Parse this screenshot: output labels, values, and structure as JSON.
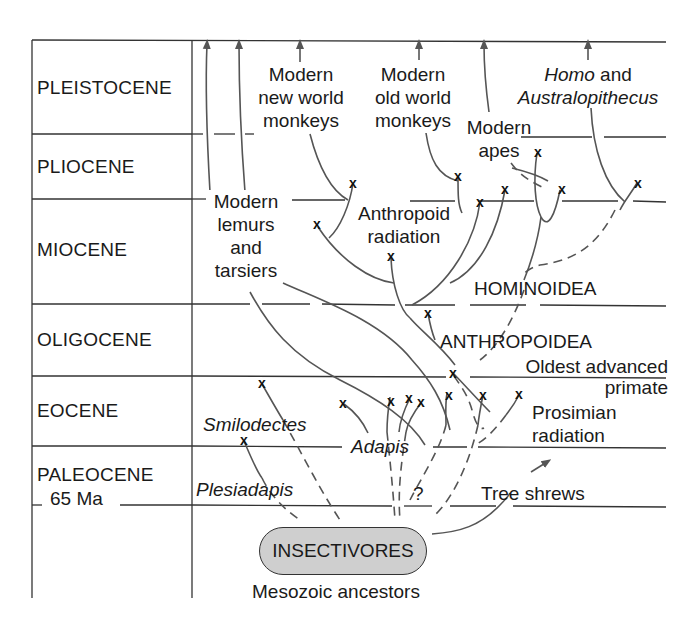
{
  "epochs": [
    {
      "name": "PLEISTOCENE"
    },
    {
      "name": "PLIOCENE"
    },
    {
      "name": "MIOCENE"
    },
    {
      "name": "OLIGOCENE"
    },
    {
      "name": "EOCENE"
    },
    {
      "name": "PALEOCENE"
    }
  ],
  "boundary_label": "65 Ma",
  "lineages": {
    "new_world_monkeys": [
      "Modern",
      "new world",
      "monkeys"
    ],
    "old_world_monkeys": [
      "Modern",
      "old world",
      "monkeys"
    ],
    "modern_apes": [
      "Modern",
      "apes"
    ],
    "homo": {
      "italic": "Homo",
      "plain": " and",
      "line2": "Australopithecus"
    },
    "lemurs": [
      "Modern",
      "lemurs",
      "and",
      "tarsiers"
    ],
    "anthropoid_radiation": [
      "Anthropoid",
      "radiation"
    ],
    "hominoidea": "HOMINOIDEA",
    "anthropoidea": "ANTHROPOIDEA",
    "oldest_advanced_primate": [
      "Oldest advanced",
      "primate"
    ],
    "prosimian_radiation": [
      "Prosimian",
      "radiation"
    ],
    "smilodectes": "Smilodectes",
    "adapis": "Adapis",
    "plesiadapis": "Plesiadapis",
    "question_mark": "?",
    "tree_shrews": "Tree shrews"
  },
  "root": {
    "label": "INSECTIVORES",
    "caption": "Mesozoic ancestors"
  },
  "colors": {
    "line": "#555555",
    "text": "#1a1a1a",
    "root_fill": "#cfcfcf",
    "extinction_mark": "#111111"
  }
}
